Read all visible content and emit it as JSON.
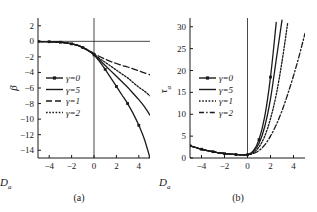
{
  "figure": {
    "background": "#ffffff",
    "ink": "#1a1a1a"
  },
  "panels": [
    {
      "id": "a",
      "caption": "(a)",
      "ylabel": "β",
      "xlabel": "D",
      "xlabel_sub": "a"
    },
    {
      "id": "b",
      "caption": "(b)",
      "ylabel": "τ",
      "ylabel_sub": "a",
      "xlabel": "D",
      "xlabel_sub": "a"
    }
  ],
  "chart_data": [
    {
      "type": "line",
      "title": "(a)",
      "xlabel": "D_a",
      "ylabel": "beta",
      "xlim": [
        -5,
        5
      ],
      "ylim": [
        -15,
        3
      ],
      "xticks": [
        -4,
        -2,
        0,
        2,
        4
      ],
      "yticks": [
        2,
        0,
        -2,
        -4,
        -6,
        -8,
        -10,
        -12,
        -14
      ],
      "grid": false,
      "legend_position": "center-left",
      "x": [
        -5,
        -4.5,
        -4,
        -3.5,
        -3,
        -2.5,
        -2,
        -1.5,
        -1,
        -0.5,
        0,
        0.5,
        1,
        1.5,
        2,
        2.5,
        3,
        3.5,
        4,
        4.5,
        5
      ],
      "series": [
        {
          "name": "γ=0",
          "style": "solid-marker",
          "values": [
            -0.02,
            -0.03,
            -0.05,
            -0.08,
            -0.12,
            -0.2,
            -0.32,
            -0.5,
            -0.8,
            -1.2,
            -1.75,
            -2.6,
            -3.6,
            -4.7,
            -5.8,
            -6.9,
            -8.0,
            -9.3,
            -10.8,
            -12.6,
            -15.0
          ]
        },
        {
          "name": "γ=5",
          "style": "solid",
          "values": [
            -0.02,
            -0.03,
            -0.05,
            -0.08,
            -0.12,
            -0.2,
            -0.32,
            -0.5,
            -0.8,
            -1.2,
            -1.7,
            -2.4,
            -3.1,
            -3.8,
            -4.5,
            -5.2,
            -5.9,
            -6.7,
            -7.5,
            -8.4,
            -9.5
          ]
        },
        {
          "name": "γ=1",
          "style": "dashed",
          "values": [
            -0.02,
            -0.03,
            -0.05,
            -0.08,
            -0.12,
            -0.2,
            -0.32,
            -0.5,
            -0.8,
            -1.15,
            -1.55,
            -1.95,
            -2.3,
            -2.6,
            -2.85,
            -3.1,
            -3.3,
            -3.55,
            -3.8,
            -4.05,
            -4.3
          ]
        },
        {
          "name": "γ=2",
          "style": "dotted",
          "values": [
            -0.02,
            -0.03,
            -0.05,
            -0.08,
            -0.12,
            -0.2,
            -0.32,
            -0.5,
            -0.8,
            -1.18,
            -1.65,
            -2.2,
            -2.7,
            -3.2,
            -3.7,
            -4.2,
            -4.7,
            -5.3,
            -5.9,
            -6.4,
            -7.0
          ]
        }
      ]
    },
    {
      "type": "line",
      "title": "(b)",
      "xlabel": "D_a",
      "ylabel": "tau_a",
      "xlim": [
        -5,
        5
      ],
      "ylim": [
        0,
        32
      ],
      "xticks": [
        -4,
        -2,
        0,
        2,
        4
      ],
      "yticks": [
        0,
        5,
        10,
        15,
        20,
        25,
        30
      ],
      "grid": false,
      "legend_position": "center-left",
      "x": [
        -5,
        -4.5,
        -4,
        -3.5,
        -3,
        -2.5,
        -2,
        -1.5,
        -1,
        -0.5,
        0,
        0.5,
        1,
        1.5,
        2,
        2.5,
        3,
        3.5,
        4,
        4.5,
        5
      ],
      "series": [
        {
          "name": "γ=0",
          "style": "solid-marker",
          "values": [
            2.8,
            2.4,
            2.0,
            1.7,
            1.45,
            1.2,
            1.0,
            0.9,
            0.8,
            0.72,
            0.75,
            1.6,
            4.2,
            9.5,
            18.5,
            31.0,
            null,
            null,
            null,
            null,
            null
          ]
        },
        {
          "name": "γ=5",
          "style": "solid",
          "values": [
            2.8,
            2.4,
            2.0,
            1.7,
            1.45,
            1.2,
            1.0,
            0.9,
            0.8,
            0.72,
            0.75,
            1.4,
            3.3,
            7.2,
            13.5,
            22.5,
            31.5,
            null,
            null,
            null,
            null
          ]
        },
        {
          "name": "γ=1",
          "style": "dotted",
          "values": [
            2.8,
            2.4,
            2.0,
            1.7,
            1.45,
            1.2,
            1.0,
            0.9,
            0.8,
            0.72,
            0.75,
            1.2,
            2.5,
            5.0,
            9.0,
            14.5,
            22.0,
            31.0,
            null,
            null,
            null
          ]
        },
        {
          "name": "γ=2",
          "style": "dashdot",
          "values": [
            2.8,
            2.4,
            2.0,
            1.7,
            1.45,
            1.2,
            1.0,
            0.9,
            0.8,
            0.72,
            0.75,
            1.0,
            1.7,
            3.0,
            5.0,
            7.6,
            10.8,
            14.6,
            18.8,
            23.4,
            28.5
          ]
        }
      ]
    }
  ]
}
